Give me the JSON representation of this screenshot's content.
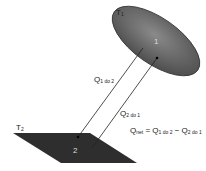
{
  "diagram": {
    "surface1": {
      "temp_label": "T",
      "temp_sub": "1",
      "number": "1",
      "shape": "ellipse",
      "fill": "#6b6b6b"
    },
    "surface2": {
      "temp_label": "T",
      "temp_sub": "2",
      "number": "2",
      "shape": "parallelogram",
      "fill": "#333333"
    },
    "arrows": [
      {
        "label": "Q",
        "sub": "1 do 2",
        "from": "surface1",
        "to": "surface2"
      },
      {
        "label": "Q",
        "sub": "2 do 1",
        "from": "surface2",
        "to": "surface1"
      }
    ],
    "equation": {
      "lhs": "Q",
      "lhs_sub": "net",
      "eq": " = ",
      "t1": "Q",
      "t1_sub": "1 do 2",
      "minus": " − ",
      "t2": "Q",
      "t2_sub": "2 do 1"
    }
  }
}
